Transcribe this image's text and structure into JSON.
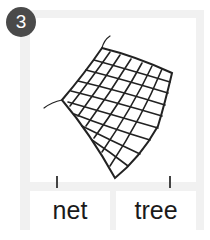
{
  "question_number": "3",
  "image": {
    "subject": "net",
    "icon": "net-icon"
  },
  "choices": [
    {
      "label": "net"
    },
    {
      "label": "tree"
    }
  ],
  "colors": {
    "frame": "#f1f1f1",
    "badge": "#4a4a4a",
    "text": "#1a1a1a"
  }
}
